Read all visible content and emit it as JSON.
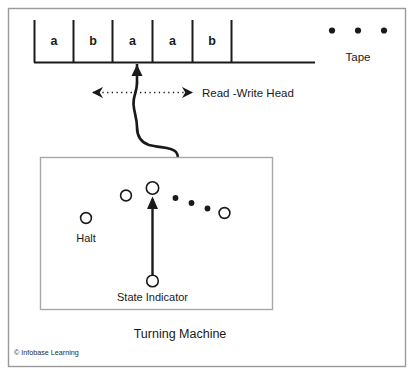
{
  "figure": {
    "title": "Turning Machine",
    "copyright": "© Infobase Learning",
    "outer_border_color": "#9a9a9a",
    "inner_border_color": "#a8a8a8",
    "ink_color": "#1a1a1a",
    "background_color": "#ffffff"
  },
  "tape": {
    "label": "Tape",
    "cells": [
      {
        "symbol": "a"
      },
      {
        "symbol": "b"
      },
      {
        "symbol": "a"
      },
      {
        "symbol": "a"
      },
      {
        "symbol": "b"
      },
      {
        "symbol": ""
      }
    ],
    "continuation_dots": 3
  },
  "head": {
    "label": "Read -Write Head",
    "direction_arrow": "bidirectional-dotted"
  },
  "machine": {
    "state_indicator_label": "State Indicator",
    "halt_label": "Halt",
    "states_count": 4,
    "ellipsis_dots": 3
  }
}
